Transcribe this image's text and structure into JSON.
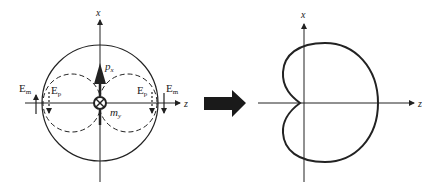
{
  "left_diagram": {
    "axis_x_label": "x",
    "axis_z_label": "z",
    "dipole_p_label": "p",
    "dipole_p_sub": "x",
    "dipole_m_label": "m",
    "dipole_m_sub": "y",
    "field_left_m": "E",
    "field_left_m_sub": "m",
    "field_left_p": "E",
    "field_left_p_sub": "p",
    "field_right_p": "E",
    "field_right_p_sub": "p",
    "field_right_m": "E",
    "field_right_m_sub": "m"
  },
  "right_diagram": {
    "axis_x_label": "x",
    "axis_z_label": "z",
    "shape": "cardioid"
  },
  "colors": {
    "ink": "#222222",
    "arrow": "#1a1a1a"
  }
}
